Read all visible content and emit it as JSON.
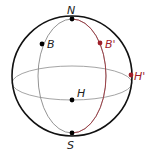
{
  "diagram": {
    "type": "sphere-points",
    "colors": {
      "sphere": "#111111",
      "meridian": "#888888",
      "equator": "#9a9a9a",
      "accent": "#a0202a",
      "point": "#000000",
      "label": "#222222"
    },
    "points": [
      {
        "id": "N",
        "label": "N",
        "color": "black"
      },
      {
        "id": "S",
        "label": "S",
        "color": "black"
      },
      {
        "id": "B",
        "label": "B",
        "color": "black"
      },
      {
        "id": "H",
        "label": "H",
        "color": "black"
      },
      {
        "id": "Bp",
        "label": "B'",
        "color": "accent"
      },
      {
        "id": "Hp",
        "label": "H'",
        "color": "accent"
      }
    ]
  }
}
